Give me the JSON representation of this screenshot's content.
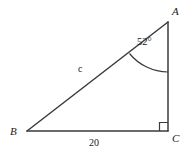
{
  "figure": {
    "kind": "right-triangle-diagram",
    "background_color": "#ffffff",
    "stroke_color": "#3b3b3b",
    "text_color": "#1a1a1a",
    "width": 191,
    "height": 158,
    "vertices": {
      "A": {
        "label": "A",
        "x": 168,
        "y": 22
      },
      "B": {
        "label": "B",
        "x": 27,
        "y": 131
      },
      "C": {
        "label": "C",
        "x": 168,
        "y": 131
      }
    },
    "sides": {
      "hypotenuse": {
        "label": "c",
        "from": "B",
        "to": "A"
      },
      "base": {
        "label": "20",
        "from": "B",
        "to": "C"
      },
      "vertical": {
        "label": "",
        "from": "A",
        "to": "C"
      }
    },
    "angles": {
      "at_A": {
        "label": "52°",
        "value": 52,
        "unit": "degrees"
      },
      "at_C": {
        "label": "right-angle",
        "value": 90,
        "unit": "degrees",
        "marker": "square"
      }
    }
  }
}
